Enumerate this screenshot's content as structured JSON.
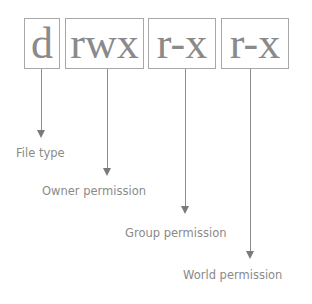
{
  "diagram": {
    "segments": [
      {
        "text": "d",
        "label": "File type"
      },
      {
        "text": "rwx",
        "label": "Owner permission"
      },
      {
        "text": "r-x",
        "label": "Group permission"
      },
      {
        "text": "r-x",
        "label": "World permission"
      }
    ]
  },
  "colors": {
    "box_border": "#a8a8a8",
    "text": "#8a8a8a",
    "arrow": "#7a7a7a"
  }
}
